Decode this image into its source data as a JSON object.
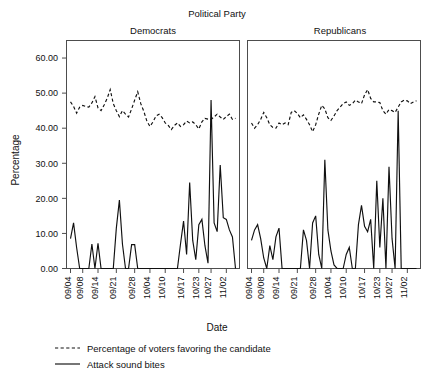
{
  "chart_data": {
    "type": "line",
    "title": "Political Party",
    "xlabel": "Date",
    "ylabel": "Percentage",
    "ylim": [
      0,
      65
    ],
    "yticks": [
      0,
      10,
      20,
      30,
      40,
      50,
      60
    ],
    "ytick_labels": [
      "0.00",
      "10.00",
      "20.00",
      "30.00",
      "40.00",
      "50.00",
      "60.00"
    ],
    "grid": false,
    "legend_position": "bottom-left",
    "legend": [
      {
        "label": "Percentage of voters favoring the candidate",
        "style": "dashed"
      },
      {
        "label": "Attack sound bites",
        "style": "solid"
      }
    ],
    "xtick_labels": [
      "09/04",
      "09/08",
      "09/14",
      "09/21",
      "09/28",
      "10/04",
      "10/10",
      "10/17",
      "10/23",
      "10/27",
      "11/02"
    ],
    "xtick_index": [
      0,
      4,
      9,
      15,
      21,
      26,
      31,
      37,
      42,
      46,
      51
    ],
    "x_count": 55,
    "panels": [
      {
        "name": "Democrats",
        "series": [
          {
            "name": "Percentage of voters favoring the candidate",
            "style": "dashed",
            "values": [
              47.5,
              46.2,
              44.3,
              46.0,
              46.5,
              46.2,
              46.0,
              47.2,
              49.0,
              45.8,
              45.0,
              46.6,
              48.5,
              51.0,
              47.0,
              45.0,
              43.3,
              45.0,
              44.0,
              43.2,
              45.5,
              48.0,
              50.4,
              47.0,
              44.8,
              42.0,
              40.5,
              41.8,
              43.5,
              44.0,
              43.0,
              41.5,
              40.8,
              39.6,
              40.8,
              41.5,
              40.5,
              41.0,
              42.0,
              41.5,
              41.8,
              41.0,
              39.8,
              41.8,
              42.8,
              42.6,
              42.5,
              43.2,
              44.0,
              43.2,
              42.5,
              43.3,
              44.0,
              42.5,
              42.8
            ]
          },
          {
            "name": "Attack sound bites",
            "style": "solid",
            "values": [
              8.5,
              13.0,
              6.0,
              0.0,
              0.0,
              0.0,
              0.0,
              7.0,
              0.0,
              7.2,
              0.0,
              0.0,
              0.0,
              0.0,
              0.0,
              11.5,
              19.5,
              7.0,
              0.0,
              0.0,
              6.8,
              6.8,
              0.0,
              0.0,
              0.0,
              0.0,
              0.0,
              0.0,
              0.0,
              0.0,
              0.0,
              0.0,
              0.0,
              0.0,
              0.0,
              0.0,
              7.0,
              13.5,
              4.0,
              24.5,
              8.0,
              2.5,
              12.5,
              14.0,
              6.5,
              1.5,
              48.0,
              13.0,
              10.5,
              29.5,
              14.5,
              14.0,
              11.0,
              9.0,
              0.0
            ]
          }
        ]
      },
      {
        "name": "Republicans",
        "series": [
          {
            "name": "Percentage of voters favoring the candidate",
            "style": "dashed",
            "values": [
              41.5,
              40.0,
              41.0,
              42.5,
              44.5,
              43.0,
              41.0,
              40.2,
              40.0,
              41.5,
              41.0,
              41.5,
              41.0,
              44.5,
              45.0,
              44.2,
              43.0,
              43.8,
              42.5,
              41.0,
              39.0,
              41.0,
              44.0,
              46.5,
              45.5,
              43.0,
              42.2,
              43.5,
              45.0,
              46.0,
              47.0,
              47.5,
              46.5,
              47.0,
              48.0,
              47.5,
              47.0,
              49.5,
              51.0,
              48.5,
              47.5,
              47.5,
              47.3,
              45.0,
              44.0,
              45.3,
              45.0,
              44.5,
              46.0,
              47.5,
              48.0,
              47.8,
              47.0,
              47.5,
              47.8
            ]
          },
          {
            "name": "Attack sound bites",
            "style": "solid",
            "values": [
              8.0,
              11.0,
              12.5,
              8.5,
              3.0,
              0.0,
              6.5,
              2.5,
              9.0,
              11.5,
              0.0,
              0.0,
              0.0,
              0.0,
              0.0,
              0.0,
              0.0,
              11.0,
              8.0,
              0.0,
              13.0,
              15.0,
              4.0,
              0.0,
              31.0,
              11.0,
              5.0,
              1.0,
              0.0,
              0.0,
              0.0,
              4.0,
              6.0,
              0.0,
              0.0,
              12.5,
              18.0,
              12.0,
              10.5,
              14.0,
              0.0,
              25.0,
              6.0,
              20.0,
              0.0,
              29.0,
              8.5,
              0.0,
              45.0,
              0.0,
              0.0,
              0.0,
              0.0,
              0.0,
              0.0
            ]
          }
        ]
      }
    ]
  }
}
